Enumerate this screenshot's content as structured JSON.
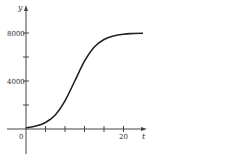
{
  "chart_data": {
    "type": "line",
    "title": "",
    "xlabel": "t",
    "ylabel": "y",
    "xlim": [
      0,
      24
    ],
    "ylim": [
      0,
      9000
    ],
    "x_ticks": [
      0,
      4,
      8,
      12,
      16,
      20
    ],
    "x_tick_labels": [
      "0",
      "",
      "",
      "",
      "",
      "20"
    ],
    "y_ticks": [
      0,
      2000,
      4000,
      6000,
      8000
    ],
    "y_tick_labels": [
      "",
      "",
      "4000",
      "",
      "8000"
    ],
    "grid": false,
    "series": [
      {
        "name": "logistic growth",
        "x": [
          0,
          2,
          4,
          6,
          8,
          10,
          12,
          14,
          16,
          18,
          20,
          22,
          24
        ],
        "y": [
          100,
          240,
          540,
          1170,
          2350,
          4000,
          5650,
          6830,
          7460,
          7760,
          7900,
          7960,
          7985
        ]
      }
    ]
  }
}
